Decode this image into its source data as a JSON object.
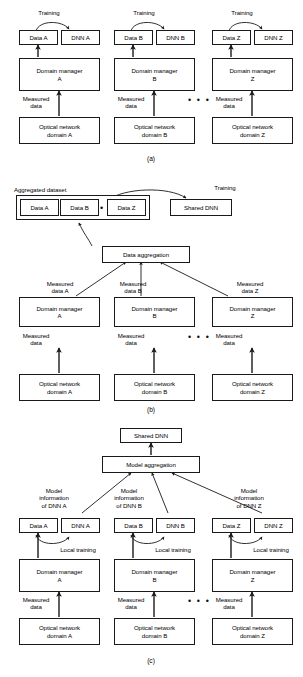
{
  "figure": {
    "panels": [
      {
        "id": "a",
        "label": "(a)",
        "name": "independent-local-training",
        "columns": [
          {
            "suffix": "A",
            "data_box": "Data A",
            "dnn_box": "DNN A",
            "training_label": "Training",
            "manager_box": "Domain manager\nA",
            "measured_label": "Measured\ndata",
            "network_box": "Optical network\ndomain A"
          },
          {
            "suffix": "B",
            "data_box": "Data B",
            "dnn_box": "DNN B",
            "training_label": "Training",
            "manager_box": "Domain manager\nB",
            "measured_label": "Measured\ndata",
            "network_box": "Optical network\ndomain B"
          },
          {
            "suffix": "Z",
            "data_box": "Data Z",
            "dnn_box": "DNN Z",
            "training_label": "Training",
            "manager_box": "Domain manager\nZ",
            "measured_label": "Measured\ndata",
            "network_box": "Optical network\ndomain Z"
          }
        ],
        "ellipsis": "• • •"
      },
      {
        "id": "b",
        "label": "(b)",
        "name": "centralized-data-aggregation",
        "aggregated_dataset_label": "Aggregated dataset",
        "dataset_cells": [
          "Data A",
          "Data B",
          "Data Z"
        ],
        "dataset_ellipsis": "• • •",
        "training_label": "Training",
        "shared_dnn_box": "Shared DNN",
        "aggregation_box": "Data aggregation",
        "columns": [
          {
            "suffix": "A",
            "measured_named_label": "Measured\ndata A",
            "manager_box": "Domain manager\nA",
            "measured_label": "Measured\ndata",
            "network_box": "Optical network\ndomain A"
          },
          {
            "suffix": "B",
            "measured_named_label": "Measured\ndata B",
            "manager_box": "Domain manager\nB",
            "measured_label": "Measured\ndata",
            "network_box": "Optical network\ndomain B"
          },
          {
            "suffix": "Z",
            "measured_named_label": "Measured\ndata Z",
            "manager_box": "Domain manager\nZ",
            "measured_label": "Measured\ndata",
            "network_box": "Optical network\ndomain Z"
          }
        ],
        "ellipsis": "• • •"
      },
      {
        "id": "c",
        "label": "(c)",
        "name": "federated-model-aggregation",
        "shared_dnn_box": "Shared DNN",
        "aggregation_box": "Model aggregation",
        "columns": [
          {
            "suffix": "A",
            "model_info_label": "Model\ninformation\nof DNN A",
            "data_box": "Data A",
            "dnn_box": "DNN A",
            "local_training_label": "Local training",
            "manager_box": "Domain manager\nA",
            "measured_label": "Measured\ndata",
            "network_box": "Optical network\ndomain A"
          },
          {
            "suffix": "B",
            "model_info_label": "Model\ninformation\nof DNN B",
            "data_box": "Data B",
            "dnn_box": "DNN B",
            "local_training_label": "Local training",
            "manager_box": "Domain manager\nB",
            "measured_label": "Measured\ndata",
            "network_box": "Optical network\ndomain B"
          },
          {
            "suffix": "Z",
            "model_info_label": "Model\ninformation\nof DNN Z",
            "data_box": "Data Z",
            "dnn_box": "DNN Z",
            "local_training_label": "Local training",
            "manager_box": "Domain manager\nZ",
            "measured_label": "Measured\ndata",
            "network_box": "Optical network\ndomain Z"
          }
        ],
        "ellipsis": "• • •"
      }
    ],
    "colors": {
      "stroke": "#1a1a1a",
      "background": "#ffffff",
      "text": "#000000"
    }
  }
}
